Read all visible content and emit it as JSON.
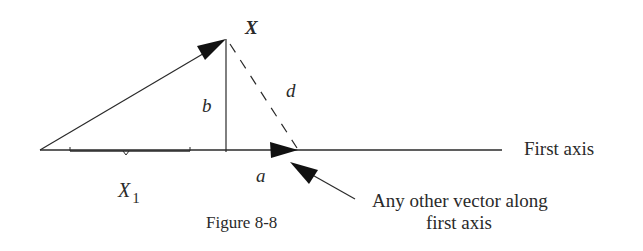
{
  "figure": {
    "caption": "Figure 8-8",
    "labels": {
      "vector_x": "X",
      "b": "b",
      "d": "d",
      "a": "a",
      "x1_main": "X",
      "x1_sub": "1",
      "axis": "First axis",
      "annotation_line1": "Any other vector along",
      "annotation_line2": "first axis"
    },
    "colors": {
      "ink": "#2a2a2a",
      "background": "#ffffff"
    }
  }
}
